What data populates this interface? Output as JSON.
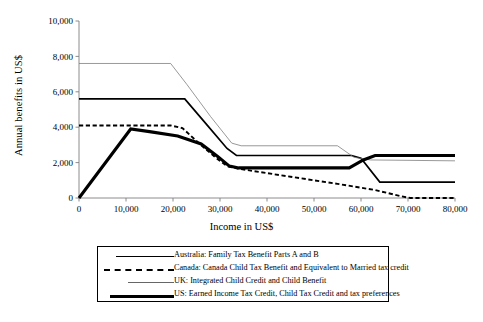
{
  "chart_data": {
    "type": "line",
    "title": "",
    "xlabel": "Income in US$",
    "ylabel": "Annual benefits in US$",
    "xlim": [
      0,
      80000
    ],
    "ylim": [
      0,
      10000
    ],
    "xticks": [
      "0",
      "10,000",
      "20,000",
      "30,000",
      "40,000",
      "50,000",
      "60,000",
      "70,000",
      "80,000"
    ],
    "xtick_values": [
      0,
      10000,
      20000,
      30000,
      40000,
      50000,
      60000,
      70000,
      80000
    ],
    "yticks": [
      "0",
      "2,000",
      "4,000",
      "6,000",
      "8,000",
      "10,000"
    ],
    "ytick_values": [
      0,
      2000,
      4000,
      6000,
      8000,
      10000
    ],
    "grid": false,
    "legend_position": "below",
    "series": [
      {
        "name": "Australia: Family Tax Benefit Parts A and B",
        "style": "solid-medium",
        "color": "#000000",
        "points": [
          [
            0,
            5600
          ],
          [
            22500,
            5600
          ],
          [
            27000,
            4200
          ],
          [
            31500,
            2800
          ],
          [
            33500,
            2400
          ],
          [
            58000,
            2400
          ],
          [
            60000,
            2250
          ],
          [
            64000,
            900
          ],
          [
            80000,
            900
          ]
        ]
      },
      {
        "name": "Canada: Canada Child Tax Benefit and Equivalent to Married tax credit",
        "style": "dashed",
        "color": "#000000",
        "points": [
          [
            0,
            4100
          ],
          [
            19500,
            4100
          ],
          [
            22000,
            3950
          ],
          [
            25500,
            3100
          ],
          [
            29000,
            2300
          ],
          [
            31500,
            1800
          ],
          [
            34000,
            1650
          ],
          [
            45000,
            1200
          ],
          [
            55000,
            800
          ],
          [
            63000,
            450
          ],
          [
            68500,
            100
          ],
          [
            70500,
            0
          ],
          [
            80000,
            0
          ]
        ]
      },
      {
        "name": "UK: Integrated Child Credit and Child Benefit",
        "style": "solid-thin",
        "color": "#777777",
        "points": [
          [
            0,
            7600
          ],
          [
            19500,
            7600
          ],
          [
            23000,
            6400
          ],
          [
            28000,
            4600
          ],
          [
            32500,
            3100
          ],
          [
            34500,
            2950
          ],
          [
            55000,
            2950
          ],
          [
            58500,
            2300
          ],
          [
            62000,
            2150
          ],
          [
            80000,
            2100
          ]
        ]
      },
      {
        "name": "US: Earned Income Tax Credit, Child Tax Credit and tax preferences",
        "style": "solid-thick",
        "color": "#000000",
        "points": [
          [
            0,
            0
          ],
          [
            11000,
            3900
          ],
          [
            15000,
            3750
          ],
          [
            21000,
            3500
          ],
          [
            26000,
            3050
          ],
          [
            29500,
            2350
          ],
          [
            32000,
            1800
          ],
          [
            34000,
            1700
          ],
          [
            57500,
            1700
          ],
          [
            60500,
            2150
          ],
          [
            63000,
            2400
          ],
          [
            80000,
            2400
          ]
        ]
      }
    ]
  },
  "legend": {
    "items": [
      {
        "label": "Australia: Family Tax Benefit Parts A and B"
      },
      {
        "label": "Canada: Canada Child Tax Benefit and Equivalent to Married tax credit"
      },
      {
        "label": "UK: Integrated Child Credit and Child Benefit"
      },
      {
        "label": "US: Earned Income Tax Credit, Child Tax Credit and tax preferences"
      }
    ]
  }
}
